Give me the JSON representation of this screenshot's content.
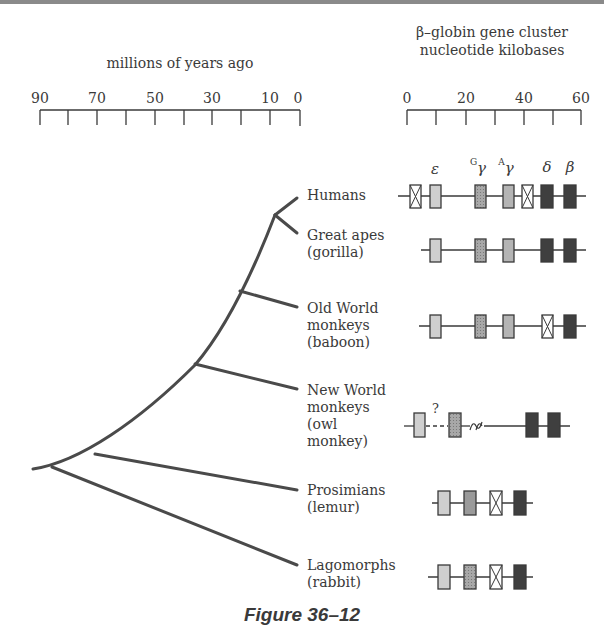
{
  "figure": {
    "caption": "Figure 36–12"
  },
  "time_axis": {
    "title": "millions of years ago",
    "tick_labels": [
      "90",
      "70",
      "50",
      "30",
      "10",
      "0"
    ],
    "tick_values": [
      90,
      70,
      50,
      30,
      10,
      0
    ],
    "minor_ticks": [
      90,
      80,
      70,
      60,
      50,
      40,
      30,
      20,
      10,
      0
    ]
  },
  "kb_axis": {
    "title_line1": "β–globin gene cluster",
    "title_line2": "nucleotide kilobases",
    "tick_labels": [
      "0",
      "20",
      "40",
      "60"
    ],
    "tick_values": [
      0,
      20,
      40,
      60
    ],
    "minor_ticks": [
      0,
      10,
      20,
      30,
      40,
      50,
      60
    ]
  },
  "gene_labels": {
    "epsilon": "ε",
    "g_gamma_sup": "G",
    "g_gamma": "γ",
    "a_gamma_sup": "A",
    "a_gamma": "γ",
    "delta": "δ",
    "beta": "β"
  },
  "species": [
    {
      "line1": "Humans",
      "line2": "",
      "line3": "",
      "line4": ""
    },
    {
      "line1": "Great apes",
      "line2": "(gorilla)",
      "line3": "",
      "line4": ""
    },
    {
      "line1": "Old World",
      "line2": "monkeys",
      "line3": "(baboon)",
      "line4": ""
    },
    {
      "line1": "New World",
      "line2": "monkeys",
      "line3": "(owl",
      "line4": "monkey)"
    },
    {
      "line1": "Prosimians",
      "line2": "(lemur)",
      "line3": "",
      "line4": ""
    },
    {
      "line1": "Lagomorphs",
      "line2": "(rabbit)",
      "line3": "",
      "line4": ""
    }
  ],
  "uncertain_marker": "?",
  "divergence_times_mya": {
    "humans_great_apes": 8,
    "old_world_monkeys": 20,
    "new_world_monkeys": 35,
    "prosimians": 75,
    "lagomorphs": 85
  },
  "legend_semantics": {
    "light": "embryonic ε gene",
    "medium": "fetal γ genes",
    "dark": "adult δ/β genes",
    "crossed": "pseudogene"
  },
  "colors": {
    "ink": "#3a3a3a",
    "tree": "#4a4a4a",
    "light_gene": "#c8c8c8",
    "medium_gene": "#9a9a9a",
    "dark_gene": "#3f3f3f",
    "background": "#ffffff"
  }
}
